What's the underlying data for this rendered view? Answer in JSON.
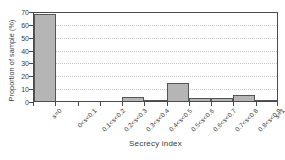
{
  "chart_data": {
    "type": "bar",
    "title": "",
    "xlabel": "Secrecy index",
    "ylabel": "Proportion of sample (%)",
    "categories": [
      "s=0",
      "0<s<0.1",
      "0.1<s<0.2",
      "0.2<s<0.3",
      "0.3<s<0.4",
      "0.4<s<0.5",
      "0.5<s<0.6",
      "0.6<s<0.7",
      "0.7<s<0.8",
      "0.8<s<0.9",
      "s=1"
    ],
    "values": [
      68,
      0,
      0,
      0,
      3,
      0.5,
      14,
      2.5,
      2,
      4.5,
      1
    ],
    "ylim": [
      0,
      70
    ],
    "yticks": [
      0,
      10,
      20,
      30,
      40,
      50,
      60,
      70
    ],
    "ytick_labels": [
      "0",
      "10",
      "20",
      "30",
      "40",
      "50",
      "60",
      "70"
    ],
    "grid": true,
    "grid_axis": "y",
    "legend": false,
    "bar_color": "#b5b5b5",
    "bar_edge_color": "#555555",
    "axis_color": "#4a4a4a",
    "grid_color": "#c8c8c8",
    "background": "#ffffff"
  }
}
